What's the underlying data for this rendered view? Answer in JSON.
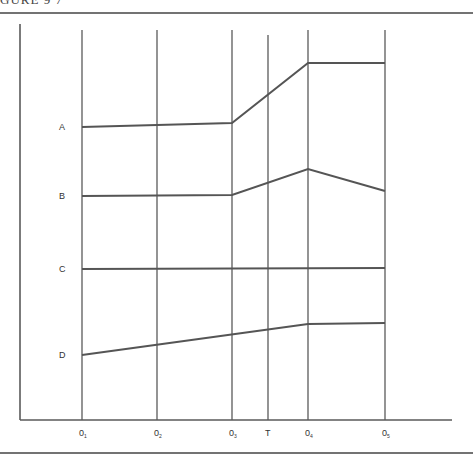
{
  "caption": "GURE 9 7",
  "chart_data": {
    "type": "line",
    "title": "",
    "xlabel": "",
    "ylabel": "",
    "grid": true,
    "categories": [
      "O1",
      "O2",
      "O3",
      "T",
      "O4",
      "O5"
    ],
    "x_tick_labels": [
      {
        "base": "0",
        "sub": "1"
      },
      {
        "base": "0",
        "sub": "2"
      },
      {
        "base": "0",
        "sub": "3"
      },
      {
        "base": "T",
        "sub": ""
      },
      {
        "base": "0",
        "sub": "4"
      },
      {
        "base": "0",
        "sub": "5"
      }
    ],
    "observation_points": [
      "O1",
      "O2",
      "O3",
      "O4",
      "O5"
    ],
    "treatment_point": "T",
    "series": [
      {
        "name": "A",
        "points": [
          [
            "O1",
            127
          ],
          [
            "O3",
            123
          ],
          [
            "O4",
            63
          ],
          [
            "O5",
            63
          ]
        ],
        "description": "flat, then rises sharply after T, flat at higher level"
      },
      {
        "name": "B",
        "points": [
          [
            "O1",
            196
          ],
          [
            "O3",
            195
          ],
          [
            "O4",
            169
          ],
          [
            "O5",
            191
          ]
        ],
        "description": "flat, rises after T to peak at O4, then declines"
      },
      {
        "name": "C",
        "points": [
          [
            "O1",
            269
          ],
          [
            "O5",
            268
          ]
        ],
        "description": "flat throughout"
      },
      {
        "name": "D",
        "points": [
          [
            "O1",
            355
          ],
          [
            "O4",
            324
          ],
          [
            "O5",
            323
          ]
        ],
        "description": "steady rise through O4, flat to O5"
      }
    ],
    "y_units": "pixel position (lower = higher value)"
  },
  "labels": {
    "series_names": [
      "A",
      "B",
      "C",
      "D"
    ]
  }
}
